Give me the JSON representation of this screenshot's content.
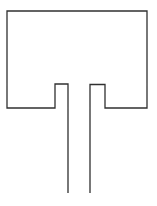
{
  "figure": {
    "background_color": "#ffffff",
    "stroke_color": "#303030",
    "stroke_width": "1.3",
    "outline_path": "M 68 193 L 68 84 L 55 84 L 55 108 L 7 108 L 7 11 L 147 11 L 147 108 L 105 108 L 105 84.5 L 90 84.5 L 90 193"
  }
}
